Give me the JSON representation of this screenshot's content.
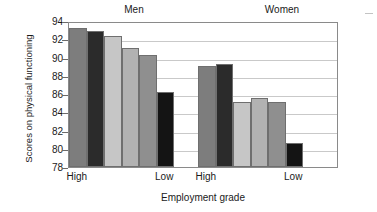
{
  "chart_data": {
    "type": "bar",
    "title": "",
    "xlabel": "Employment grade",
    "ylabel": "Scores on physical functioning",
    "ylim": [
      78,
      94
    ],
    "ytick_step": 2,
    "yticks": [
      94,
      92,
      90,
      88,
      86,
      84,
      82,
      80,
      78
    ],
    "grid": true,
    "legend": "none",
    "group_labels": [
      "Men",
      "Women"
    ],
    "xtick_labels": [
      "High",
      "Low",
      "High",
      "Low"
    ],
    "bar_colors": [
      "#7d7d7d",
      "#2b2b2b",
      "#c6c6c6",
      "#b2b2b2",
      "#8f8f8f",
      "#141414"
    ],
    "groups": [
      {
        "name": "Men",
        "categories": [
          "1",
          "2",
          "3",
          "4",
          "5",
          "6"
        ],
        "values": [
          93.2,
          92.9,
          92.4,
          91.0,
          90.3,
          86.2
        ]
      },
      {
        "name": "Women",
        "categories": [
          "1",
          "2",
          "3",
          "4",
          "5",
          "6"
        ],
        "values": [
          89.1,
          89.3,
          85.1,
          85.6,
          85.1,
          80.6
        ]
      }
    ]
  },
  "axes": {
    "y_title": "Scores on physical functioning",
    "x_title": "Employment grade",
    "y_tick_labels": [
      "94",
      "92",
      "90",
      "88",
      "86",
      "84",
      "82",
      "80",
      "78"
    ],
    "x_tick_labels": {
      "men_high": "High",
      "men_low": "Low",
      "women_high": "High",
      "women_low": "Low"
    }
  },
  "headings": {
    "men": "Men",
    "women": "Women"
  }
}
